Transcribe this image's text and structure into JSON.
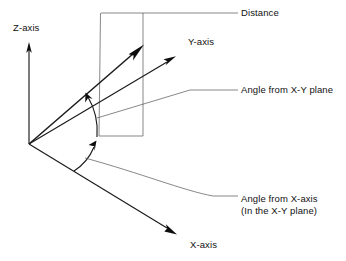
{
  "diagram": {
    "background_color": "#ffffff",
    "line_color": "#1a1a1a",
    "leader_color": "#555555",
    "labels": {
      "distance": "Distance",
      "z_axis": "Z-axis",
      "y_axis": "Y-axis",
      "x_axis": "X-axis",
      "angle_from_xy_plane": "Angle from X-Y plane",
      "angle_from_x_axis_line1": "Angle from X-axis",
      "angle_from_x_axis_line2": "(In the X-Y plane)"
    },
    "icons": {
      "z_axis_arrow": "arrow-up-icon",
      "y_axis_arrow": "arrow-upright-icon",
      "x_axis_arrow": "arrow-downright-icon",
      "distance_arrow": "arrow-upright-icon",
      "elevation_arc_arrow": "arc-arrow-icon",
      "azimuth_arc_arrow": "arc-arrow-icon"
    },
    "geometry": {
      "origin": [
        29,
        144
      ],
      "z_axis_tip": [
        29,
        44
      ],
      "y_axis_tip": [
        175,
        57
      ],
      "x_axis_tip": [
        176,
        234
      ],
      "distance_vector_tip": [
        143,
        45
      ],
      "projection_point": [
        143,
        136
      ],
      "reference_box": [
        [
          101,
          13
        ],
        [
          143,
          13
        ],
        [
          143,
          136
        ],
        [
          99,
          136
        ]
      ],
      "elevation_arc": {
        "start": [
          86,
          95
        ],
        "end": [
          97,
          137
        ]
      },
      "azimuth_arc": {
        "start": [
          95,
          144
        ],
        "end": [
          74,
          171
        ]
      }
    }
  }
}
